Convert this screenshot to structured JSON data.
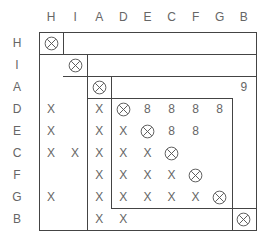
{
  "matrix": {
    "order": [
      "H",
      "I",
      "A",
      "D",
      "E",
      "C",
      "F",
      "G",
      "B"
    ],
    "col_headers": [
      "H",
      "I",
      "A",
      "D",
      "E",
      "C",
      "F",
      "G",
      "B"
    ],
    "row_headers": [
      "H",
      "I",
      "A",
      "D",
      "E",
      "C",
      "F",
      "G",
      "B"
    ],
    "rows": [
      [
        "⊗",
        "",
        "",
        "",
        "",
        "",
        "",
        "",
        ""
      ],
      [
        "",
        "⊗",
        "",
        "",
        "",
        "",
        "",
        "",
        ""
      ],
      [
        "",
        "",
        "⊗",
        "",
        "",
        "",
        "",
        "",
        "9"
      ],
      [
        "X",
        "",
        "X",
        "⊗",
        "8",
        "8",
        "8",
        "8",
        ""
      ],
      [
        "X",
        "",
        "X",
        "X",
        "⊗",
        "8",
        "8",
        "",
        ""
      ],
      [
        "X",
        "X",
        "X",
        "X",
        "X",
        "⊗",
        "",
        "",
        ""
      ],
      [
        "",
        "",
        "X",
        "X",
        "X",
        "X",
        "⊗",
        "",
        ""
      ],
      [
        "X",
        "",
        "X",
        "X",
        "X",
        "X",
        "X",
        "⊗",
        ""
      ],
      [
        "",
        "",
        "X",
        "X",
        "",
        "",
        "",
        "",
        "⊗"
      ]
    ],
    "blocks": [
      {
        "name": "H",
        "rows": [
          0,
          0
        ],
        "cols": [
          0,
          0
        ]
      },
      {
        "name": "I",
        "rows": [
          1,
          1
        ],
        "cols": [
          1,
          1
        ]
      },
      {
        "name": "A",
        "rows": [
          2,
          2
        ],
        "cols": [
          2,
          2
        ]
      },
      {
        "name": "DECFG",
        "rows": [
          3,
          7
        ],
        "cols": [
          3,
          7
        ]
      },
      {
        "name": "B",
        "rows": [
          8,
          8
        ],
        "cols": [
          8,
          8
        ]
      }
    ]
  },
  "colors": {
    "line": "#444444",
    "text": "#666666"
  }
}
